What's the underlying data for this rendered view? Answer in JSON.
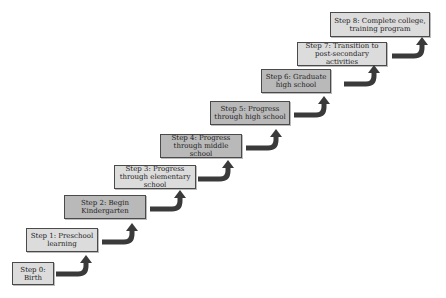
{
  "diagram": {
    "type": "staircase",
    "steps": [
      {
        "label": "Step 0: Birth",
        "shade": "light"
      },
      {
        "label": "Step 1: Preschool learning",
        "shade": "light"
      },
      {
        "label": "Step 2: Begin Kindergarten",
        "shade": "dark"
      },
      {
        "label": "Step 3: Progress through elementary school",
        "shade": "light"
      },
      {
        "label": "Step 4: Progress through middle school",
        "shade": "dark"
      },
      {
        "label": "Step 5: Progress through high school",
        "shade": "dark"
      },
      {
        "label": "Step 6: Graduate high school",
        "shade": "dark"
      },
      {
        "label": "Step 7: Transition to post-secondary activities",
        "shade": "light"
      },
      {
        "label": "Step 8: Complete college, training program",
        "shade": "light"
      }
    ],
    "colors": {
      "light_fill": "#dcdcdc",
      "dark_fill": "#b9b9b9",
      "border": "#4a4a4a",
      "arrow": "#3a3a3a"
    }
  }
}
